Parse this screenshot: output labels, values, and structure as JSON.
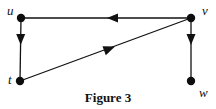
{
  "figure": {
    "caption": "Figure 3",
    "caption_pos": {
      "x": 108,
      "y": 102
    }
  },
  "vertices": [
    {
      "id": "u",
      "label": "u",
      "x": 21,
      "y": 18,
      "label_x": 8,
      "label_y": 15
    },
    {
      "id": "v",
      "label": "v",
      "x": 191,
      "y": 18,
      "label_x": 202,
      "label_y": 15
    },
    {
      "id": "t",
      "label": "t",
      "x": 20,
      "y": 81,
      "label_x": 8,
      "label_y": 84
    },
    {
      "id": "w",
      "label": "w",
      "x": 191,
      "y": 81,
      "label_x": 200,
      "label_y": 96
    }
  ],
  "edges": [
    {
      "from": "v",
      "to": "u",
      "directed": true,
      "arrow_at": 0.45
    },
    {
      "from": "u",
      "to": "t",
      "directed": true,
      "arrow_at": 0.33
    },
    {
      "from": "t",
      "to": "v",
      "directed": true,
      "arrow_at": 0.53
    },
    {
      "from": "v",
      "to": "w",
      "directed": true,
      "arrow_at": 0.33
    }
  ],
  "colors": {
    "ink": "#111111",
    "background": "#ffffff"
  }
}
